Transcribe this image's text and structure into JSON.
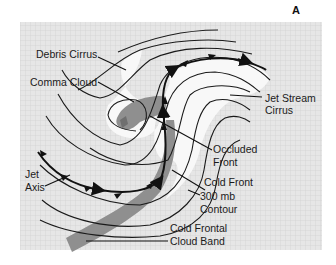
{
  "figure": {
    "panel_letter": "A",
    "colors": {
      "background": "#ffffff",
      "grid_fill": "#e6e6e6",
      "grid_line": "#c9c9c9",
      "cirrus_white": "#f8f8f8",
      "cloud_gray": "#8f8f8f",
      "line": "#1a1a1a"
    },
    "labels": {
      "debris_cirrus": "Debris Cirrus",
      "comma_cloud": "Comma Cloud",
      "jet_stream_cirrus_1": "Jet Stream",
      "jet_stream_cirrus_2": "Cirrus",
      "occluded_front_1": "Occluded",
      "occluded_front_2": "Front",
      "jet_axis_1": "Jet",
      "jet_axis_2": "Axis",
      "cold_front": "Cold Front",
      "contour_1": "300 mb",
      "contour_2": "Contour",
      "cloud_band_1": "Cold Frontal",
      "cloud_band_2": "Cloud Band"
    }
  }
}
